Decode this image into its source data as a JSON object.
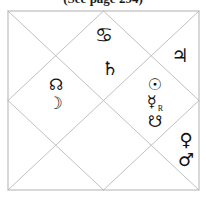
{
  "caption": {
    "text": "(See page 294)"
  },
  "chart": {
    "style_label": "North Indian Vedic Birth Chart",
    "frame": {
      "left": 8,
      "top": 11,
      "right": 199,
      "bottom": 190,
      "line_color": "#b9b9b9",
      "border_color": "#a8a8a8",
      "line_width": 0.9
    },
    "center": {
      "x": 103.5,
      "y": 100.5
    }
  },
  "glyphs": [
    {
      "id": "ascendant-cancer",
      "name": "cancer-sign-glyph",
      "symbol": "♋",
      "label": "Cancer",
      "x": 104,
      "y": 35,
      "size": 20,
      "weight": "bold",
      "retrograde": false
    },
    {
      "id": "jupiter",
      "name": "jupiter-glyph",
      "symbol": "♃",
      "label": "Jupiter",
      "x": 180,
      "y": 55,
      "size": 19,
      "weight": "normal",
      "retrograde": false
    },
    {
      "id": "saturn",
      "name": "saturn-glyph",
      "symbol": "♄",
      "label": "Saturn",
      "x": 110,
      "y": 68,
      "size": 19,
      "weight": "normal",
      "retrograde": false
    },
    {
      "id": "rahu",
      "name": "rahu-north-node-glyph",
      "symbol": "☊",
      "label": "Rahu",
      "x": 56,
      "y": 85,
      "size": 16,
      "weight": "bold",
      "retrograde": false
    },
    {
      "id": "moon",
      "name": "moon-glyph",
      "symbol": "☽",
      "label": "Moon",
      "x": 55,
      "y": 103,
      "size": 17,
      "weight": "normal",
      "retrograde": false
    },
    {
      "id": "sun",
      "name": "sun-glyph",
      "symbol": "☉",
      "label": "Sun",
      "x": 155,
      "y": 85,
      "size": 16,
      "weight": "normal",
      "retrograde": false
    },
    {
      "id": "mercury",
      "name": "mercury-glyph",
      "symbol": "☿",
      "label": "Mercury",
      "retrograde_mark": "R",
      "x": 155,
      "y": 104,
      "size": 16,
      "weight": "normal",
      "retrograde": true
    },
    {
      "id": "ketu",
      "name": "ketu-south-node-glyph",
      "symbol": "☋",
      "label": "Ketu",
      "x": 155,
      "y": 122,
      "size": 16,
      "weight": "bold",
      "retrograde": false
    },
    {
      "id": "venus",
      "name": "venus-glyph",
      "symbol": "♀",
      "label": "Venus",
      "x": 186,
      "y": 140,
      "size": 18,
      "weight": "normal",
      "retrograde": false
    },
    {
      "id": "mars",
      "name": "mars-glyph",
      "symbol": "♂",
      "label": "Mars",
      "x": 186,
      "y": 160,
      "size": 18,
      "weight": "normal",
      "retrograde": false
    }
  ]
}
